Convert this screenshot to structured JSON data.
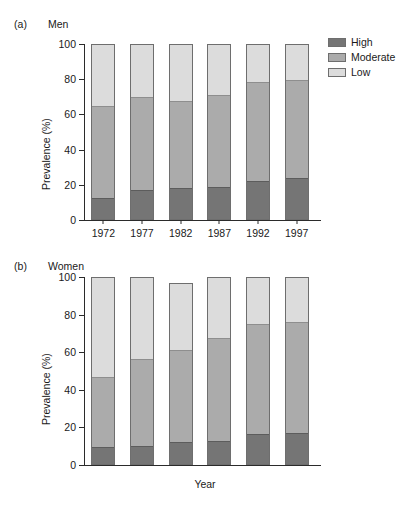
{
  "figure": {
    "background": "#ffffff"
  },
  "legend": {
    "position": "top-right",
    "items": [
      {
        "label": "High",
        "color": "#757575"
      },
      {
        "label": "Moderate",
        "color": "#ababab"
      },
      {
        "label": "Low",
        "color": "#dcdcdc"
      }
    ]
  },
  "panels": [
    {
      "tag": "(a)",
      "title": "Men",
      "ylabel": "Prevalence (%)",
      "xlabel": "",
      "yticks": [
        "0",
        "20",
        "40",
        "60",
        "80",
        "100"
      ]
    },
    {
      "tag": "(b)",
      "title": "Women",
      "ylabel": "Prevalence (%)",
      "xlabel": "Year",
      "yticks": [
        "0",
        "20",
        "40",
        "60",
        "80",
        "100"
      ]
    }
  ],
  "chart_data": [
    {
      "type": "bar",
      "stacked": true,
      "title": "Men",
      "panel_tag": "(a)",
      "xlabel": "",
      "ylabel": "Prevalence (%)",
      "ylim": [
        0,
        100
      ],
      "yticks": [
        0,
        20,
        40,
        60,
        80,
        100
      ],
      "grid": false,
      "legend_position": "top-right",
      "categories": [
        "1972",
        "1977",
        "1982",
        "1987",
        "1992",
        "1997"
      ],
      "series": [
        {
          "name": "High",
          "color": "#757575",
          "values": [
            13.0,
            17.5,
            18.5,
            19.5,
            22.5,
            24.5
          ]
        },
        {
          "name": "Moderate",
          "color": "#ababab",
          "values": [
            52.5,
            53.0,
            49.5,
            52.0,
            56.5,
            55.5
          ]
        },
        {
          "name": "Low",
          "color": "#dcdcdc",
          "values": [
            34.5,
            29.5,
            32.0,
            28.5,
            21.0,
            20.0
          ]
        }
      ],
      "cumulative_tops": {
        "High": [
          13.0,
          17.5,
          18.5,
          19.5,
          22.5,
          24.5
        ],
        "Moderate": [
          65.5,
          70.5,
          68.0,
          71.5,
          79.0,
          80.0
        ],
        "Low": [
          100.0,
          100.0,
          100.0,
          100.0,
          100.0,
          100.0
        ]
      }
    },
    {
      "type": "bar",
      "stacked": true,
      "title": "Women",
      "panel_tag": "(b)",
      "xlabel": "Year",
      "ylabel": "Prevalence (%)",
      "ylim": [
        0,
        100
      ],
      "yticks": [
        0,
        20,
        40,
        60,
        80,
        100
      ],
      "grid": false,
      "legend_position": "top-right",
      "categories": [
        "1972",
        "1977",
        "1982",
        "1987",
        "1992",
        "1997"
      ],
      "series": [
        {
          "name": "High",
          "color": "#757575",
          "values": [
            10.0,
            10.5,
            12.5,
            13.5,
            17.0,
            17.5
          ]
        },
        {
          "name": "Moderate",
          "color": "#ababab",
          "values": [
            37.5,
            46.5,
            49.0,
            54.5,
            58.5,
            59.0
          ]
        },
        {
          "name": "Low",
          "color": "#dcdcdc",
          "values": [
            52.5,
            43.0,
            35.5,
            32.0,
            24.5,
            23.5
          ]
        }
      ],
      "cumulative_tops": {
        "High": [
          10.0,
          10.5,
          12.5,
          13.5,
          17.0,
          17.5
        ],
        "Moderate": [
          47.5,
          57.0,
          61.5,
          68.0,
          75.5,
          76.5
        ],
        "Low": [
          100.0,
          100.0,
          97.0,
          100.0,
          100.0,
          100.0
        ]
      }
    }
  ]
}
